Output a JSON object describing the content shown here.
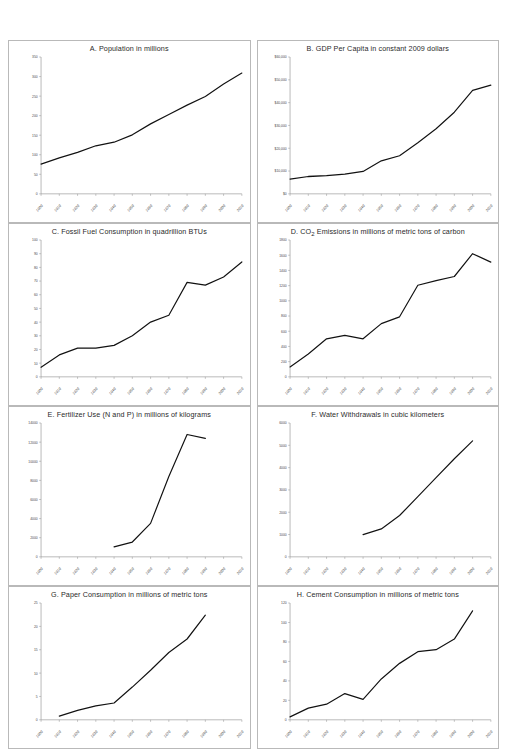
{
  "figure": {
    "name": "eight-panel-indicator-figure",
    "background": "#ffffff",
    "line_color": "#111111",
    "axis_color": "#9b9b9b",
    "panel_border_color": "#b9b9b9"
  },
  "chart_data": [
    {
      "id": "A",
      "type": "line",
      "title": "A.  Population in millions",
      "label": "A.",
      "caption": "Population in millions",
      "xlabel": "",
      "ylabel": "",
      "grid": false,
      "legend": "none",
      "xlim": [
        1900,
        2010
      ],
      "ylim": [
        0,
        350
      ],
      "ytick_step": 50,
      "ytick_labels": [
        "0",
        "50",
        "100",
        "150",
        "200",
        "250",
        "300",
        "350"
      ],
      "xtick_labels": [
        "1900",
        "1910",
        "1920",
        "1930",
        "1940",
        "1950",
        "1960",
        "1970",
        "1980",
        "1990",
        "2000",
        "2010"
      ],
      "x": [
        1900,
        1910,
        1920,
        1930,
        1940,
        1950,
        1960,
        1970,
        1980,
        1990,
        2000,
        2010
      ],
      "values": [
        76,
        92,
        106,
        123,
        132,
        151,
        179,
        203,
        227,
        249,
        281,
        309
      ]
    },
    {
      "id": "B",
      "type": "line",
      "title": "B.  GDP Per Capita in constant 2009 dollars",
      "label": "B.",
      "caption": "GDP Per Capita in constant 2009 dollars",
      "xlabel": "",
      "ylabel": "",
      "grid": false,
      "legend": "none",
      "xlim": [
        1900,
        2010
      ],
      "ylim": [
        0,
        60000
      ],
      "ytick_step": 10000,
      "ytick_labels": [
        "$0",
        "$10,000",
        "$20,000",
        "$30,000",
        "$40,000",
        "$50,000",
        "$60,000"
      ],
      "xtick_labels": [
        "1900",
        "1910",
        "1920",
        "1930",
        "1940",
        "1950",
        "1960",
        "1970",
        "1980",
        "1990",
        "2000",
        "2010"
      ],
      "x": [
        1900,
        1910,
        1920,
        1930,
        1940,
        1950,
        1960,
        1970,
        1980,
        1990,
        2000,
        2010
      ],
      "values": [
        6500,
        7600,
        8000,
        8600,
        9800,
        14500,
        16700,
        22400,
        28500,
        35800,
        45400,
        47700
      ]
    },
    {
      "id": "C",
      "type": "line",
      "title": "C.  Fossil Fuel Consumption in quadrillion BTUs",
      "label": "C.",
      "caption": "Fossil Fuel Consumption in quadrillion BTUs",
      "xlabel": "",
      "ylabel": "",
      "grid": false,
      "legend": "none",
      "xlim": [
        1900,
        2010
      ],
      "ylim": [
        0,
        100
      ],
      "ytick_step": 10,
      "ytick_labels": [
        "0",
        "10",
        "20",
        "30",
        "40",
        "50",
        "60",
        "70",
        "80",
        "90",
        "100"
      ],
      "xtick_labels": [
        "1900",
        "1910",
        "1920",
        "1930",
        "1940",
        "1950",
        "1960",
        "1970",
        "1980",
        "1990",
        "2000",
        "2010"
      ],
      "x": [
        1900,
        1910,
        1920,
        1930,
        1940,
        1950,
        1960,
        1970,
        1980,
        1990,
        2000,
        2010
      ],
      "values": [
        7,
        16,
        21,
        21,
        23,
        30,
        40,
        45,
        69,
        67,
        73,
        84
      ]
    },
    {
      "id": "D",
      "type": "line",
      "title": "D.  CO2 Emissions in millions of metric tons of carbon",
      "label": "D.",
      "caption_pre": "CO",
      "caption_sub": "2",
      "caption_post": " Emissions in millions of metric tons of carbon",
      "xlabel": "",
      "ylabel": "",
      "grid": false,
      "legend": "none",
      "xlim": [
        1900,
        2010
      ],
      "ylim": [
        0,
        1800
      ],
      "ytick_step": 200,
      "ytick_labels": [
        "0",
        "200",
        "400",
        "600",
        "800",
        "1000",
        "1200",
        "1400",
        "1600",
        "1800"
      ],
      "xtick_labels": [
        "1900",
        "1910",
        "1920",
        "1930",
        "1940",
        "1950",
        "1960",
        "1970",
        "1980",
        "1990",
        "2000",
        "2010"
      ],
      "x": [
        1900,
        1910,
        1920,
        1930,
        1940,
        1950,
        1960,
        1970,
        1980,
        1990,
        2000,
        2010
      ],
      "values": [
        130,
        300,
        500,
        545,
        500,
        700,
        790,
        1205,
        1265,
        1320,
        1620,
        1510
      ]
    },
    {
      "id": "E",
      "type": "line",
      "title": "E.  Fertilizer Use (N and P) in millions of kilograms",
      "label": "E.",
      "caption": "Fertilizer Use (N and P) in millions of kilograms",
      "xlabel": "",
      "ylabel": "",
      "grid": false,
      "legend": "none",
      "xlim": [
        1900,
        2010
      ],
      "ylim": [
        0,
        14000
      ],
      "ytick_step": 2000,
      "ytick_labels": [
        "0",
        "2000",
        "4000",
        "6000",
        "8000",
        "10000",
        "12000",
        "14000"
      ],
      "xtick_labels": [
        "1900",
        "1910",
        "1920",
        "1930",
        "1940",
        "1950",
        "1960",
        "1970",
        "1980",
        "1990",
        "2000",
        "2010"
      ],
      "x": [
        1940,
        1950,
        1960,
        1970,
        1980,
        1990
      ],
      "values": [
        1050,
        1550,
        3500,
        8400,
        12800,
        12400
      ]
    },
    {
      "id": "F",
      "type": "line",
      "title": "F.  Water Withdrawals in cubic kilometers",
      "label": "F.",
      "caption": "Water Withdrawals in cubic kilometers",
      "xlabel": "",
      "ylabel": "",
      "grid": false,
      "legend": "none",
      "xlim": [
        1900,
        2010
      ],
      "ylim": [
        0,
        6000
      ],
      "ytick_step": 1000,
      "ytick_labels": [
        "0",
        "1000",
        "2000",
        "3000",
        "4000",
        "5000",
        "6000"
      ],
      "xtick_labels": [
        "1900",
        "1910",
        "1920",
        "1930",
        "1940",
        "1950",
        "1960",
        "1970",
        "1980",
        "1990",
        "2000",
        "2010"
      ],
      "x": [
        1940,
        1950,
        1960,
        1970,
        1980,
        1990,
        2000
      ],
      "values": [
        1000,
        1250,
        1850,
        2700,
        3550,
        4400,
        5200
      ]
    },
    {
      "id": "G",
      "type": "line",
      "title": "G.  Paper Consumption in millions of metric tons",
      "label": "G.",
      "caption": "Paper Consumption in millions of metric tons",
      "xlabel": "",
      "ylabel": "",
      "grid": false,
      "legend": "none",
      "xlim": [
        1900,
        2010
      ],
      "ylim": [
        0,
        25
      ],
      "ytick_step": 5,
      "ytick_labels": [
        "0",
        "5",
        "10",
        "15",
        "20",
        "25"
      ],
      "xtick_labels": [
        "1900",
        "1910",
        "1920",
        "1930",
        "1940",
        "1950",
        "1960",
        "1970",
        "1980",
        "1990",
        "2000",
        "2010"
      ],
      "x": [
        1910,
        1920,
        1930,
        1940,
        1950,
        1960,
        1970,
        1980,
        1990
      ],
      "values": [
        0.8,
        2.0,
        3.0,
        3.6,
        7.0,
        10.6,
        14.4,
        17.3,
        22.4
      ]
    },
    {
      "id": "H",
      "type": "line",
      "title": "H.  Cement Consumption in millions of metric tons",
      "label": "H.",
      "caption": "Cement Consumption in millions of metric tons",
      "xlabel": "",
      "ylabel": "",
      "grid": false,
      "legend": "none",
      "xlim": [
        1900,
        2010
      ],
      "ylim": [
        0,
        120
      ],
      "ytick_step": 20,
      "ytick_labels": [
        "0",
        "20",
        "40",
        "60",
        "80",
        "100",
        "120"
      ],
      "xtick_labels": [
        "1900",
        "1910",
        "1920",
        "1930",
        "1940",
        "1950",
        "1960",
        "1970",
        "1980",
        "1990",
        "2000",
        "2010"
      ],
      "x": [
        1900,
        1910,
        1920,
        1930,
        1940,
        1950,
        1960,
        1970,
        1980,
        1990,
        2000
      ],
      "values": [
        3,
        12,
        16,
        27,
        21,
        42,
        58,
        70,
        72,
        83,
        112
      ]
    }
  ]
}
